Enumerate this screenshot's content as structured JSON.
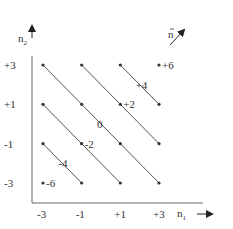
{
  "diagram": {
    "axis_labels": {
      "y": "n",
      "y_sub": "2",
      "x": "n",
      "x_sub": "1",
      "vector": "n"
    },
    "y_ticks": [
      "+3",
      "+1",
      "-1",
      "-3"
    ],
    "x_ticks": [
      "-3",
      "-1",
      "+1",
      "+3"
    ],
    "grid_values": [
      -3,
      -1,
      1,
      3
    ],
    "lines": [
      {
        "sum": 4,
        "label": "+4"
      },
      {
        "sum": 2,
        "label": "+2"
      },
      {
        "sum": 0,
        "label": "0"
      },
      {
        "sum": -2,
        "label": "-2"
      },
      {
        "sum": -4,
        "label": "-4"
      }
    ],
    "points": [
      {
        "sum": 6,
        "label": "+6"
      },
      {
        "sum": -6,
        "label": "-6"
      }
    ],
    "colors": {
      "ink": "#333333",
      "line": "#555555"
    }
  }
}
